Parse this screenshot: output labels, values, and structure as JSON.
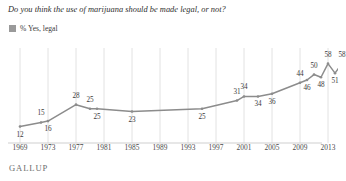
{
  "title": "Do you think the use of marijuana should be made legal, or not?",
  "legend": {
    "label": "% Yes, legal",
    "swatch_color": "#9a9a9a",
    "icon": "square-swatch-icon"
  },
  "footer": {
    "brand": "GALLUP"
  },
  "colors": {
    "line": "#8c8c8c",
    "grid": "#e2e2e2",
    "axis": "#cfcfcf",
    "text": "#3a3a3a"
  },
  "chart_data": {
    "type": "line",
    "title": "Do you think the use of marijuana should be made legal, or not?",
    "xlabel": "",
    "ylabel": "",
    "ylim": [
      0,
      65
    ],
    "xlim": [
      1969,
      2015
    ],
    "grid": true,
    "legend_position": "top-left",
    "series": [
      {
        "name": "% Yes, legal",
        "color": "#8c8c8c",
        "x": [
          1969,
          1972,
          1973,
          1977,
          1979,
          1980,
          1985,
          1995,
          2000,
          2001,
          2003,
          2005,
          2009,
          2010,
          2011,
          2012,
          2013,
          2014,
          2015
        ],
        "values": [
          12,
          15,
          16,
          28,
          25,
          25,
          23,
          25,
          31,
          34,
          34,
          36,
          44,
          46,
          50,
          48,
          58,
          51,
          58
        ],
        "labels": [
          "12",
          "15",
          "16",
          "28",
          "25",
          "25",
          "23",
          "25",
          "31",
          "34",
          "34",
          "36",
          "44",
          "46",
          "50",
          "48",
          "58",
          "51",
          "58"
        ]
      }
    ],
    "xticks": [
      "1969",
      "1973",
      "1977",
      "1981",
      "1985",
      "1989",
      "1993",
      "1997",
      "2001",
      "2005",
      "2009",
      "2013"
    ],
    "xtick_values": [
      1969,
      1973,
      1977,
      1981,
      1985,
      1989,
      1993,
      1997,
      2001,
      2005,
      2009,
      2013
    ]
  }
}
